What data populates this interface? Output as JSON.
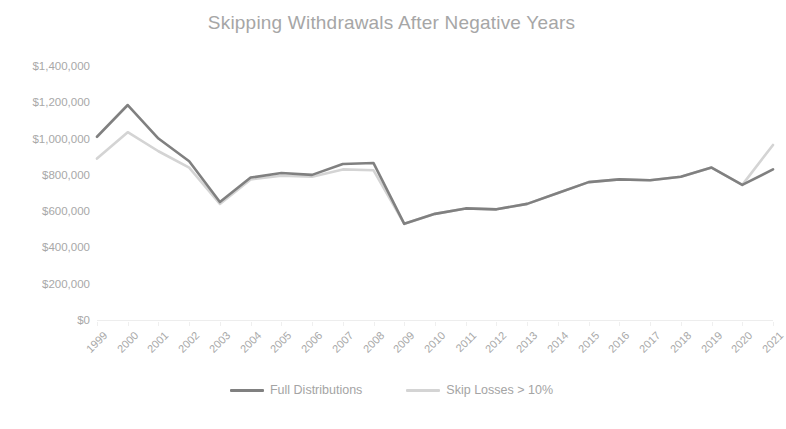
{
  "chart_data": {
    "type": "line",
    "title": "Skipping Withdrawals After Negative Years",
    "xlabel": "",
    "ylabel": "",
    "grid": false,
    "legend_position": "bottom",
    "x": [
      1999,
      2000,
      2001,
      2002,
      2003,
      2004,
      2005,
      2006,
      2007,
      2008,
      2009,
      2010,
      2011,
      2012,
      2013,
      2014,
      2015,
      2016,
      2017,
      2018,
      2019,
      2020,
      2021
    ],
    "categories": [
      "1999",
      "2000",
      "2001",
      "2002",
      "2003",
      "2004",
      "2005",
      "2006",
      "2007",
      "2008",
      "2009",
      "2010",
      "2011",
      "2012",
      "2013",
      "2014",
      "2015",
      "2016",
      "2017",
      "2018",
      "2019",
      "2020",
      "2021"
    ],
    "ylim": [
      0,
      1400000
    ],
    "yticks": [
      0,
      200000,
      400000,
      600000,
      800000,
      1000000,
      1200000,
      1400000
    ],
    "ytick_labels": [
      "$0",
      "$200,000",
      "$400,000",
      "$600,000",
      "$800,000",
      "$1,000,000",
      "$1,200,000",
      "$1,400,000"
    ],
    "series": [
      {
        "name": "Full Distributions",
        "color": "#808080",
        "values": [
          1010000,
          1185000,
          1000000,
          875000,
          650000,
          785000,
          810000,
          800000,
          860000,
          865000,
          530000,
          585000,
          615000,
          610000,
          640000,
          700000,
          760000,
          775000,
          770000,
          790000,
          840000,
          745000,
          830000
        ]
      },
      {
        "name": "Skip Losses > 10%",
        "color": "#d4d4d4",
        "values": [
          890000,
          1035000,
          930000,
          840000,
          640000,
          775000,
          795000,
          790000,
          830000,
          825000,
          530000,
          585000,
          615000,
          610000,
          640000,
          700000,
          760000,
          775000,
          770000,
          790000,
          840000,
          745000,
          965000
        ]
      }
    ]
  },
  "legend": {
    "items": [
      {
        "label": "Full Distributions",
        "color": "#808080"
      },
      {
        "label": "Skip Losses > 10%",
        "color": "#d4d4d4"
      }
    ]
  }
}
